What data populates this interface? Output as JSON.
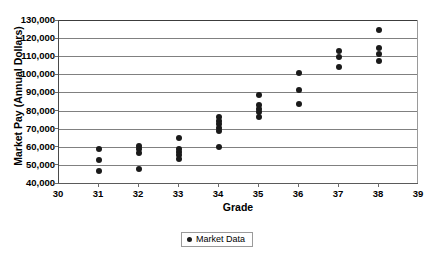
{
  "chart_data": {
    "type": "scatter",
    "title": "",
    "xlabel": "Grade",
    "ylabel": "Market Pay (Annual Dollars)",
    "xlim": [
      30,
      39
    ],
    "ylim": [
      40000,
      130000
    ],
    "x_ticks": [
      "30",
      "31",
      "32",
      "33",
      "34",
      "35",
      "36",
      "37",
      "38",
      "39"
    ],
    "x_tick_values": [
      30,
      31,
      32,
      33,
      34,
      35,
      36,
      37,
      38,
      39
    ],
    "y_ticks": [
      "40,000",
      "50,000",
      "60,000",
      "70,000",
      "80,000",
      "90,000",
      "100,000",
      "110,000",
      "120,000",
      "130,000"
    ],
    "y_tick_values": [
      40000,
      50000,
      60000,
      70000,
      80000,
      90000,
      100000,
      110000,
      120000,
      130000
    ],
    "grid": "horizontal",
    "legend_position": "bottom-center",
    "marker_color": "#1a1a1a",
    "series": [
      {
        "name": "Market Data",
        "points": [
          {
            "x": 31,
            "y": 58500
          },
          {
            "x": 31,
            "y": 52500
          },
          {
            "x": 31,
            "y": 46500
          },
          {
            "x": 32,
            "y": 60500
          },
          {
            "x": 32,
            "y": 59000
          },
          {
            "x": 32,
            "y": 56500
          },
          {
            "x": 32,
            "y": 48000
          },
          {
            "x": 33,
            "y": 65000
          },
          {
            "x": 33,
            "y": 59000
          },
          {
            "x": 33,
            "y": 57000
          },
          {
            "x": 33,
            "y": 55500
          },
          {
            "x": 33,
            "y": 53000
          },
          {
            "x": 34,
            "y": 76500
          },
          {
            "x": 34,
            "y": 74500
          },
          {
            "x": 34,
            "y": 72500
          },
          {
            "x": 34,
            "y": 70500
          },
          {
            "x": 34,
            "y": 68500
          },
          {
            "x": 34,
            "y": 60000
          },
          {
            "x": 35,
            "y": 88500
          },
          {
            "x": 35,
            "y": 83000
          },
          {
            "x": 35,
            "y": 81000
          },
          {
            "x": 35,
            "y": 79000
          },
          {
            "x": 35,
            "y": 76500
          },
          {
            "x": 36,
            "y": 101000
          },
          {
            "x": 36,
            "y": 91500
          },
          {
            "x": 36,
            "y": 83500
          },
          {
            "x": 37,
            "y": 113000
          },
          {
            "x": 37,
            "y": 109500
          },
          {
            "x": 37,
            "y": 104000
          },
          {
            "x": 38,
            "y": 124500
          },
          {
            "x": 38,
            "y": 114500
          },
          {
            "x": 38,
            "y": 111500
          },
          {
            "x": 38,
            "y": 107500
          }
        ]
      }
    ]
  },
  "legend": {
    "entries": [
      {
        "label": "Market Data",
        "marker": "filled-circle-marker",
        "color": "#1a1a1a"
      }
    ]
  }
}
